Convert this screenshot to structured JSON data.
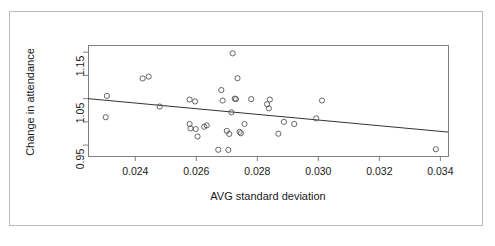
{
  "chart_data": {
    "type": "scatter",
    "title": "",
    "subtitle": "",
    "xlabel": "AVG standard deviation",
    "ylabel": "Change in attendance",
    "xlim": [
      0.02245,
      0.03425
    ],
    "ylim": [
      0.9265,
      1.1655
    ],
    "grid": false,
    "legend": null,
    "xticks": [
      0.024,
      0.026,
      0.028,
      0.03,
      0.032,
      0.034
    ],
    "xtick_labels": [
      "0.024",
      "0.026",
      "0.028",
      "0.030",
      "0.032",
      "0.034"
    ],
    "yticks": [
      0.95,
      1.05,
      1.15
    ],
    "ytick_labels": [
      "0.95",
      "1.05",
      "1.15"
    ],
    "yticks_minor": [
      1.0,
      1.1
    ],
    "point_marker": "open-circle",
    "point_color": "#555555",
    "line_color": "#333333",
    "frame_color": "#808080",
    "background": "#ffffff",
    "points": [
      {
        "x": 0.02307,
        "y": 1.056
      },
      {
        "x": 0.02303,
        "y": 1.01
      },
      {
        "x": 0.02424,
        "y": 1.0935
      },
      {
        "x": 0.02444,
        "y": 1.0975
      },
      {
        "x": 0.0248,
        "y": 1.033
      },
      {
        "x": 0.02578,
        "y": 1.048
      },
      {
        "x": 0.02578,
        "y": 0.9955
      },
      {
        "x": 0.02581,
        "y": 0.986
      },
      {
        "x": 0.02596,
        "y": 1.044
      },
      {
        "x": 0.02598,
        "y": 0.9845
      },
      {
        "x": 0.02604,
        "y": 0.9685
      },
      {
        "x": 0.02626,
        "y": 0.9895
      },
      {
        "x": 0.02634,
        "y": 0.9925
      },
      {
        "x": 0.02672,
        "y": 0.94
      },
      {
        "x": 0.02682,
        "y": 1.0685
      },
      {
        "x": 0.02686,
        "y": 1.046
      },
      {
        "x": 0.027,
        "y": 0.9805
      },
      {
        "x": 0.02705,
        "y": 0.9395
      },
      {
        "x": 0.02708,
        "y": 0.974
      },
      {
        "x": 0.02715,
        "y": 1.0205
      },
      {
        "x": 0.02719,
        "y": 1.1475
      },
      {
        "x": 0.02726,
        "y": 1.05
      },
      {
        "x": 0.0273,
        "y": 1.049
      },
      {
        "x": 0.02735,
        "y": 1.094
      },
      {
        "x": 0.02742,
        "y": 0.9785
      },
      {
        "x": 0.02746,
        "y": 0.9755
      },
      {
        "x": 0.02758,
        "y": 0.9955
      },
      {
        "x": 0.0278,
        "y": 1.049
      },
      {
        "x": 0.02832,
        "y": 1.038
      },
      {
        "x": 0.02838,
        "y": 1.029
      },
      {
        "x": 0.02841,
        "y": 1.048
      },
      {
        "x": 0.02869,
        "y": 0.9745
      },
      {
        "x": 0.02887,
        "y": 1.0
      },
      {
        "x": 0.02921,
        "y": 0.9955
      },
      {
        "x": 0.02993,
        "y": 1.0075
      },
      {
        "x": 0.03012,
        "y": 1.046
      },
      {
        "x": 0.03385,
        "y": 0.941
      }
    ],
    "fit_line": {
      "type": "linear-regression",
      "x_start": 0.02245,
      "y_start": 1.05,
      "x_end": 0.03425,
      "y_end": 0.978
    }
  }
}
